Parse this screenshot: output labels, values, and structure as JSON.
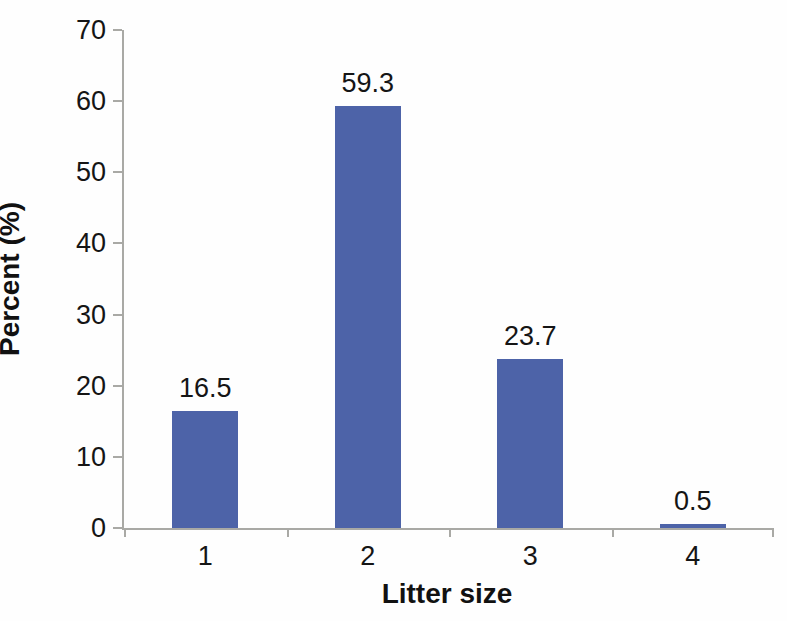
{
  "chart_data": {
    "type": "bar",
    "title": "",
    "categories": [
      "1",
      "2",
      "3",
      "4"
    ],
    "values": [
      16.5,
      59.3,
      23.7,
      0.5
    ],
    "data_labels": [
      "16.5",
      "59.3",
      "23.7",
      "0.5"
    ],
    "xlabel": "Litter size",
    "ylabel": "Percent (%)",
    "ylim": [
      0,
      70
    ],
    "yticks": [
      0,
      10,
      20,
      30,
      40,
      50,
      60,
      70
    ],
    "grid": false,
    "legend": null,
    "bar_color": "#4d63a8",
    "axis_color": "#a9a9a5"
  }
}
